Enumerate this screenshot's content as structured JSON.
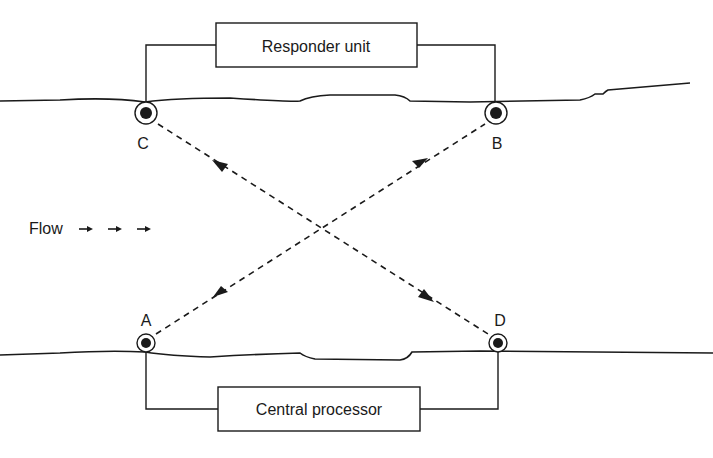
{
  "diagram": {
    "type": "ultrasonic cross-path flow meter",
    "boxes": {
      "top": {
        "label": "Responder unit"
      },
      "bottom": {
        "label": "Central processor"
      }
    },
    "nodes": [
      {
        "id": "C",
        "label": "C"
      },
      {
        "id": "B",
        "label": "B"
      },
      {
        "id": "A",
        "label": "A"
      },
      {
        "id": "D",
        "label": "D"
      }
    ],
    "paths": [
      {
        "from": "C",
        "to": "D",
        "style": "dashed",
        "arrows": "bidirectional"
      },
      {
        "from": "A",
        "to": "B",
        "style": "dashed",
        "arrows": "bidirectional"
      }
    ],
    "flow": {
      "label": "Flow",
      "arrows": "→  →  →"
    },
    "colors": {
      "ink": "#1a1a1a",
      "background": "#ffffff"
    }
  }
}
